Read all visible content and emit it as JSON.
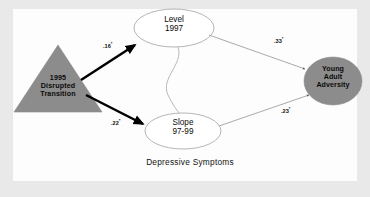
{
  "figure": {
    "caption": "Depressive Symptoms",
    "background_color": "#e9e9e9",
    "panel_color": "#fdfdfd"
  },
  "colors": {
    "shape_fill_gray": "#8c8c8c",
    "ellipse_stroke": "#a8a8a8",
    "ellipse_fill": "#ffffff",
    "bold_path": "#000000",
    "thin_path": "#9a9a9a",
    "text": "#0a0a0a"
  },
  "nodes": {
    "exogenous": {
      "id": "disrupted-transition",
      "shape": "triangle",
      "line1": "1995",
      "line2": "Disrupted",
      "line3": "Transition",
      "fill": "#8c8c8c"
    },
    "level": {
      "id": "level-1997",
      "shape": "ellipse",
      "line1": "Level",
      "line2": "1997",
      "fill": "#ffffff"
    },
    "slope": {
      "id": "slope-97-99",
      "shape": "ellipse",
      "line1": "Slope",
      "line2": "97-99",
      "fill": "#ffffff"
    },
    "outcome": {
      "id": "young-adult-adversity",
      "shape": "ellipse",
      "line1": "Young",
      "line2": "Adult",
      "line3": "Adversity",
      "fill": "#8c8c8c"
    }
  },
  "paths": [
    {
      "id": "disrupted-to-level",
      "from": "disrupted-transition",
      "to": "level-1997",
      "coefficient": ".16",
      "significance": "*",
      "style": "bold"
    },
    {
      "id": "disrupted-to-slope",
      "from": "disrupted-transition",
      "to": "slope-97-99",
      "coefficient": ".22",
      "significance": "*",
      "style": "bold"
    },
    {
      "id": "level-to-adversity",
      "from": "level-1997",
      "to": "young-adult-adversity",
      "coefficient": ".33",
      "significance": "*",
      "style": "thin"
    },
    {
      "id": "slope-to-adversity",
      "from": "slope-97-99",
      "to": "young-adult-adversity",
      "coefficient": ".23",
      "significance": "*",
      "style": "thin"
    },
    {
      "id": "level-slope-covariance",
      "from": "level-1997",
      "to": "slope-97-99",
      "coefficient": "",
      "significance": "",
      "style": "curve"
    }
  ]
}
